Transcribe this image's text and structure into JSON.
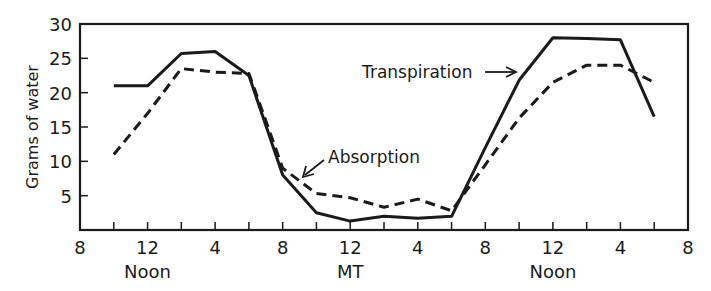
{
  "chart_data": {
    "type": "line",
    "title": "",
    "xlabel": "",
    "ylabel": "Grams of water",
    "ylim": [
      0,
      30
    ],
    "yticks": [
      5,
      10,
      15,
      20,
      25,
      30
    ],
    "xlim_hours": [
      0,
      36
    ],
    "x_hour_offset_label": "0 = 8 AM day 1",
    "xtick_labels": [
      {
        "hour": 0,
        "label": "8",
        "sub": ""
      },
      {
        "hour": 4,
        "label": "12",
        "sub": "Noon"
      },
      {
        "hour": 8,
        "label": "4",
        "sub": ""
      },
      {
        "hour": 12,
        "label": "8",
        "sub": ""
      },
      {
        "hour": 16,
        "label": "12",
        "sub": "MT"
      },
      {
        "hour": 20,
        "label": "4",
        "sub": ""
      },
      {
        "hour": 24,
        "label": "8",
        "sub": ""
      },
      {
        "hour": 28,
        "label": "12",
        "sub": "Noon"
      },
      {
        "hour": 32,
        "label": "4",
        "sub": ""
      },
      {
        "hour": 36,
        "label": "8",
        "sub": ""
      }
    ],
    "minor_tick_hours": [
      2,
      4,
      6,
      8,
      10,
      12,
      14,
      16,
      18,
      20,
      22,
      24,
      26,
      28,
      30,
      32,
      34
    ],
    "x": [
      2,
      4,
      6,
      8,
      10,
      12,
      14,
      16,
      18,
      20,
      22,
      24,
      26,
      28,
      30,
      32,
      34
    ],
    "x_time_labels": [
      "10 AM",
      "12 Noon",
      "2 PM",
      "4 PM",
      "6 PM",
      "8 PM",
      "10 PM",
      "12 MT",
      "2 AM",
      "4 AM",
      "6 AM",
      "8 AM",
      "10 AM",
      "12 Noon",
      "2 PM",
      "4 PM",
      "6 PM"
    ],
    "series": [
      {
        "name": "Transpiration",
        "style": "solid",
        "values": [
          21,
          21,
          25.7,
          26,
          22.5,
          8,
          2.5,
          1.3,
          2,
          1.7,
          2,
          12,
          21.8,
          28,
          27.9,
          27.7,
          16.5
        ]
      },
      {
        "name": "Absorption",
        "style": "dashed",
        "values": [
          11,
          17,
          23.5,
          23,
          22.8,
          9,
          5.3,
          4.7,
          3.3,
          4.5,
          2.8,
          9.5,
          16.3,
          21.5,
          24,
          24,
          21.5
        ]
      }
    ],
    "annotations": [
      {
        "text": "Transpiration",
        "points_to_series": "Transpiration"
      },
      {
        "text": "Absorption",
        "points_to_series": "Absorption"
      }
    ],
    "grid": false,
    "legend": "none (inline labels with arrows)"
  },
  "labels": {
    "ylabel": "Grams of water",
    "transpiration": "Transpiration",
    "absorption": "Absorption"
  }
}
